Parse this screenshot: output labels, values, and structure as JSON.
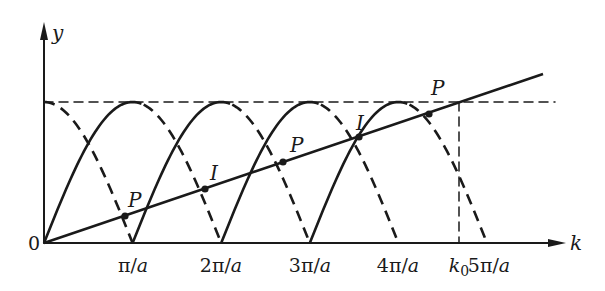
{
  "diagram": {
    "axes": {
      "y_label": "y",
      "x_label": "k",
      "origin_label": "0"
    },
    "tick_labels": [
      {
        "text": "π/a",
        "x": 133
      },
      {
        "text": "2π/a",
        "x": 221
      },
      {
        "text": "3π/a",
        "x": 310
      },
      {
        "text": "4π/a",
        "x": 398
      },
      {
        "text": "k0",
        "x": 459
      },
      {
        "text": "5π/a",
        "x": 489
      }
    ],
    "point_labels": [
      {
        "text": "P",
        "x": 128,
        "y": 207
      },
      {
        "text": "I",
        "x": 210,
        "y": 180
      },
      {
        "text": "P",
        "x": 290,
        "y": 152
      },
      {
        "text": "I",
        "x": 356,
        "y": 130
      },
      {
        "text": "P",
        "x": 431,
        "y": 95
      }
    ],
    "points": [
      {
        "label": "P",
        "x": 125,
        "y": 216
      },
      {
        "label": "I",
        "x": 205,
        "y": 189
      },
      {
        "label": "P",
        "x": 283,
        "y": 162
      },
      {
        "label": "I",
        "x": 359,
        "y": 137
      },
      {
        "label": "P",
        "x": 429,
        "y": 114
      }
    ],
    "colors": {
      "stroke": "#1a1a1a",
      "background": "#ffffff"
    }
  }
}
